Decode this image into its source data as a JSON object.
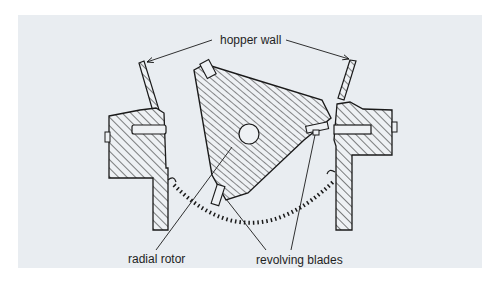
{
  "figure": {
    "type": "mechanical cross-section",
    "background_color": "#e9edf1",
    "line_color": "#1a1a1a"
  },
  "labels": {
    "hopper_wall": "hopper wall",
    "radial_rotor": "radial rotor",
    "revolving_blades": "revolving blades"
  },
  "components": [
    {
      "id": "left-hopper-wall",
      "label_ref": "hopper_wall"
    },
    {
      "id": "right-hopper-wall",
      "label_ref": "hopper_wall"
    },
    {
      "id": "left-housing",
      "hatched": true
    },
    {
      "id": "right-housing",
      "hatched": true
    },
    {
      "id": "rotor",
      "label_ref": "radial_rotor",
      "hatched": true
    },
    {
      "id": "blade-tip-top",
      "label_ref": "revolving_blades"
    },
    {
      "id": "blade-tip-right",
      "label_ref": "revolving_blades"
    },
    {
      "id": "blade-tip-bottom",
      "label_ref": "revolving_blades"
    },
    {
      "id": "rotation-path",
      "style": "dashed arc"
    }
  ]
}
